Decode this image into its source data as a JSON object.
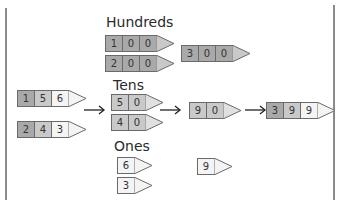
{
  "labels": {
    "hundreds": "Hundreds",
    "tens": "Tens",
    "ones": "Ones"
  },
  "inputs": {
    "first": [
      "1",
      "5",
      "6"
    ],
    "second": [
      "2",
      "4",
      "3"
    ]
  },
  "hundreds": {
    "first": [
      "1",
      "0",
      "0"
    ],
    "second": [
      "2",
      "0",
      "0"
    ],
    "sum": [
      "3",
      "0",
      "0"
    ]
  },
  "tens": {
    "first": [
      "5",
      "0"
    ],
    "second": [
      "4",
      "0"
    ],
    "sum": [
      "9",
      "0"
    ]
  },
  "ones": {
    "first": [
      "6"
    ],
    "second": [
      "3"
    ],
    "sum": [
      "9"
    ]
  },
  "result": [
    "3",
    "9",
    "9"
  ],
  "colors": {
    "hundreds_tile": "#a9a9a9",
    "tens_tile": "#c9c9c9",
    "ones_tile": "#f4f4f4",
    "tip": "#e8e8e8",
    "border": "#6a6a6a"
  }
}
